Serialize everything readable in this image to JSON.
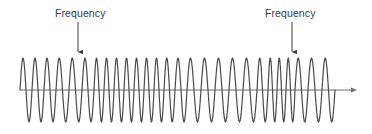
{
  "figure": {
    "background_color": "#ffffff",
    "width": 372,
    "height": 134
  },
  "annotations": [
    {
      "id": "frequency-left",
      "label": "Frequency",
      "text_x": 55,
      "text_y": 7,
      "arrow_x": 78,
      "arrow_y_start": 22,
      "arrow_y_end": 56,
      "arrow_direction": "down",
      "color": "#3c3c3c"
    },
    {
      "id": "frequency-right",
      "label": "Frequency",
      "text_x": 265,
      "text_y": 7,
      "arrow_x": 292,
      "arrow_y_start": 22,
      "arrow_y_end": 56,
      "arrow_direction": "down",
      "color": "#3c3c3c"
    }
  ],
  "axis": {
    "orientation": "horizontal",
    "x_start": 20,
    "x_end": 352,
    "y": 90,
    "arrow_head_x": 362,
    "color": "#6e6e6e",
    "stroke_width": 1
  },
  "chart_data": {
    "type": "line",
    "title": "",
    "subtitle": "",
    "xlabel": "",
    "ylabel": "",
    "grid": false,
    "legend_position": "none",
    "annotations": [
      "Frequency",
      "Frequency"
    ],
    "line_color": "#4a4a4a",
    "line_width": 1.2,
    "baseline_y": 90,
    "peak_y": 58,
    "trough_y": 123,
    "amplitude": 32,
    "wave_x_start": 20,
    "wave_x_end": 335,
    "xlim": [
      20,
      335
    ],
    "ylim": [
      -1,
      1
    ],
    "samples_per_cycle": 24,
    "cycles": [
      {
        "x_start": 20,
        "x_end": 32,
        "width": 12
      },
      {
        "x_start": 32,
        "x_end": 44,
        "width": 12
      },
      {
        "x_start": 44,
        "x_end": 56,
        "width": 12
      },
      {
        "x_start": 56,
        "x_end": 69,
        "width": 13
      },
      {
        "x_start": 69,
        "x_end": 82,
        "width": 13
      },
      {
        "x_start": 82,
        "x_end": 94,
        "width": 12
      },
      {
        "x_start": 94,
        "x_end": 104,
        "width": 10
      },
      {
        "x_start": 104,
        "x_end": 114,
        "width": 10
      },
      {
        "x_start": 114,
        "x_end": 124,
        "width": 10
      },
      {
        "x_start": 124,
        "x_end": 134,
        "width": 10
      },
      {
        "x_start": 134,
        "x_end": 144,
        "width": 10
      },
      {
        "x_start": 144,
        "x_end": 154,
        "width": 10
      },
      {
        "x_start": 154,
        "x_end": 164,
        "width": 10
      },
      {
        "x_start": 164,
        "x_end": 175,
        "width": 11
      },
      {
        "x_start": 175,
        "x_end": 187,
        "width": 12
      },
      {
        "x_start": 187,
        "x_end": 201,
        "width": 14
      },
      {
        "x_start": 201,
        "x_end": 215,
        "width": 14
      },
      {
        "x_start": 215,
        "x_end": 229,
        "width": 14
      },
      {
        "x_start": 229,
        "x_end": 243,
        "width": 14
      },
      {
        "x_start": 243,
        "x_end": 257,
        "width": 14
      },
      {
        "x_start": 257,
        "x_end": 268,
        "width": 11
      },
      {
        "x_start": 268,
        "x_end": 277,
        "width": 9
      },
      {
        "x_start": 277,
        "x_end": 286,
        "width": 9
      },
      {
        "x_start": 286,
        "x_end": 295,
        "width": 9
      },
      {
        "x_start": 295,
        "x_end": 308,
        "width": 13
      },
      {
        "x_start": 308,
        "x_end": 322,
        "width": 14
      },
      {
        "x_start": 322,
        "x_end": 335,
        "width": 13
      }
    ]
  }
}
